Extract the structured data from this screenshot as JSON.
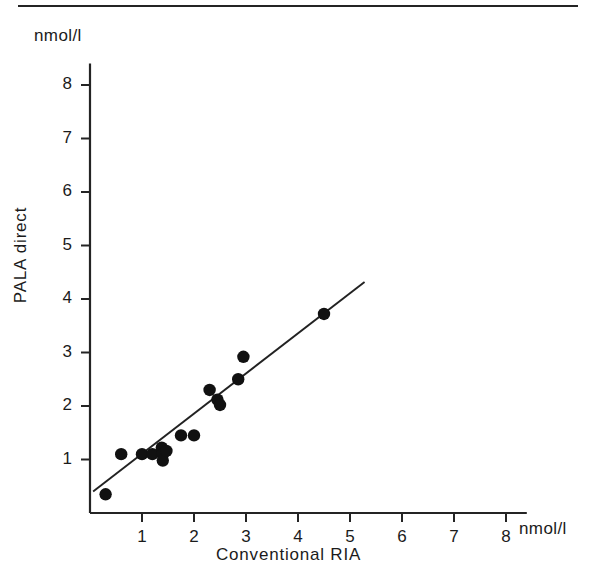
{
  "figure": {
    "type": "scatter-with-regression-line",
    "y_unit_label": "nmol/l",
    "x_unit_label": "nmol/l",
    "y_axis_title": "PALA  direct",
    "x_axis_title": "Conventional  RIA",
    "line_color": "#222222",
    "point_color": "#111111",
    "axis_color": "#242424"
  },
  "chart_data": {
    "type": "scatter",
    "title": "",
    "xlabel": "Conventional  RIA",
    "ylabel": "PALA  direct",
    "x_unit": "nmol/l",
    "y_unit": "nmol/l",
    "xlim": [
      0,
      8.4
    ],
    "ylim": [
      0,
      8.4
    ],
    "grid": false,
    "legend": null,
    "x_ticks": [
      1,
      2,
      3,
      4,
      5,
      6,
      7,
      8
    ],
    "y_ticks": [
      1,
      2,
      3,
      4,
      5,
      6,
      7,
      8
    ],
    "x_tick_labels": [
      "1",
      "2",
      "3",
      "4",
      "5",
      "6",
      "7",
      "8"
    ],
    "y_tick_labels": [
      "1",
      "2",
      "3",
      "4",
      "5",
      "6",
      "7",
      "8"
    ],
    "points": [
      {
        "x": 0.3,
        "y": 0.35
      },
      {
        "x": 0.6,
        "y": 1.1
      },
      {
        "x": 1.0,
        "y": 1.1
      },
      {
        "x": 1.2,
        "y": 1.1
      },
      {
        "x": 1.38,
        "y": 1.22
      },
      {
        "x": 1.4,
        "y": 1.1
      },
      {
        "x": 1.4,
        "y": 0.98
      },
      {
        "x": 1.47,
        "y": 1.16
      },
      {
        "x": 1.75,
        "y": 1.45
      },
      {
        "x": 2.0,
        "y": 1.45
      },
      {
        "x": 2.3,
        "y": 2.3
      },
      {
        "x": 2.45,
        "y": 2.12
      },
      {
        "x": 2.5,
        "y": 2.02
      },
      {
        "x": 2.85,
        "y": 2.5
      },
      {
        "x": 2.95,
        "y": 2.92
      },
      {
        "x": 4.5,
        "y": 3.72
      }
    ],
    "regression_line": {
      "x_start": 0.06,
      "y_start": 0.4,
      "x_end": 5.28,
      "y_end": 4.32
    }
  }
}
